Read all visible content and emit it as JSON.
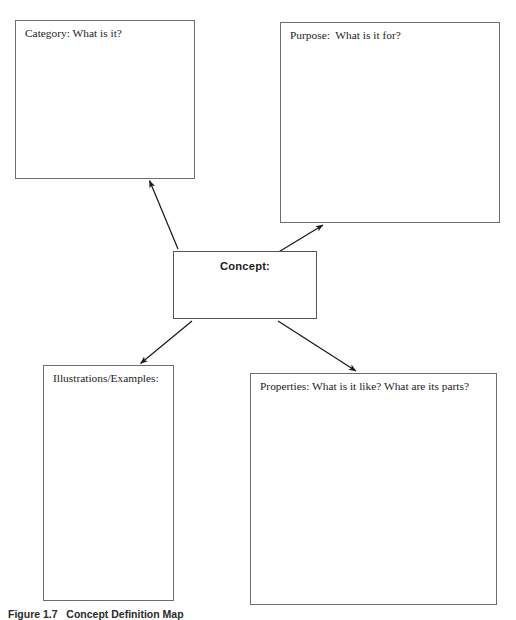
{
  "diagram": {
    "title": "Concept Definition Map",
    "type": "graphic-organizer",
    "center": {
      "id": "concept",
      "label": "Concept:",
      "bold": true
    },
    "nodes": [
      {
        "id": "category",
        "label": "Category: What is it?"
      },
      {
        "id": "purpose",
        "label": "Purpose:  What is it for?"
      },
      {
        "id": "illustrations",
        "label": "Illustrations/Examples:"
      },
      {
        "id": "properties",
        "label": "Properties: What is it like? What are its parts?"
      }
    ],
    "connectors": [
      {
        "from": "concept",
        "to": "category",
        "arrowhead": "to"
      },
      {
        "from": "concept",
        "to": "purpose",
        "arrowhead": "to"
      },
      {
        "from": "concept",
        "to": "illustrations",
        "arrowhead": "to"
      },
      {
        "from": "concept",
        "to": "properties",
        "arrowhead": "to"
      }
    ],
    "colors": {
      "background": "#ffffff",
      "box_border": "#6e6e6e",
      "connector": "#1a1a1a",
      "text": "#1d1d1d"
    }
  },
  "caption": {
    "text": "Figure 1.7   Concept Definition Map"
  }
}
